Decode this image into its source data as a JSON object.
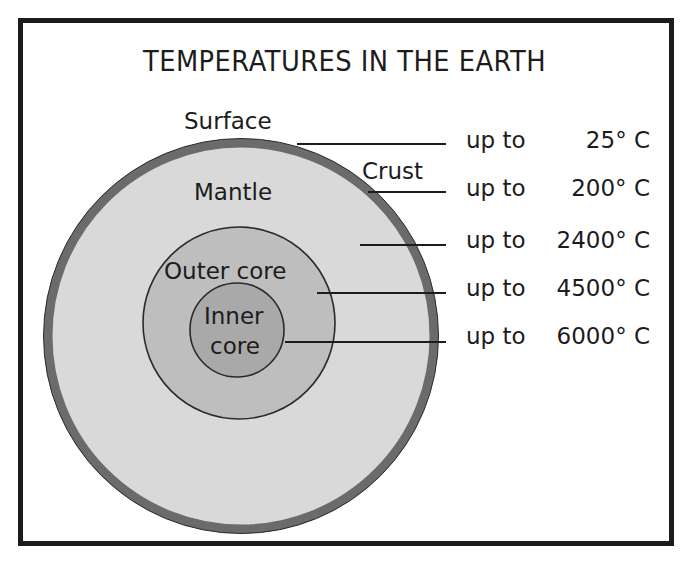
{
  "title": "TEMPERATURES IN THE EARTH",
  "colors": {
    "frame": "#1c1c1c",
    "crust": "#6b6b6b",
    "mantle": "#d9d9d9",
    "outer_core": "#bebebe",
    "inner_core": "#a9a9a9",
    "outline": "#2a2a2a",
    "pointer_line": "#1c1c1c"
  },
  "layers": [
    {
      "name": "Surface",
      "label": "Surface"
    },
    {
      "name": "Crust",
      "label": "Crust"
    },
    {
      "name": "Mantle",
      "label": "Mantle"
    },
    {
      "name": "Outer core",
      "label": "Outer core"
    },
    {
      "name": "Inner core",
      "label_line1": "Inner",
      "label_line2": "core"
    }
  ],
  "temperatures": [
    {
      "layer": "Surface",
      "prefix": "up to",
      "value": "25° C"
    },
    {
      "layer": "Crust",
      "prefix": "up to",
      "value": "200° C"
    },
    {
      "layer": "Mantle",
      "prefix": "up to",
      "value": "2400° C"
    },
    {
      "layer": "Outer core",
      "prefix": "up to",
      "value": "4500° C"
    },
    {
      "layer": "Inner core",
      "prefix": "up to",
      "value": "6000° C"
    }
  ]
}
